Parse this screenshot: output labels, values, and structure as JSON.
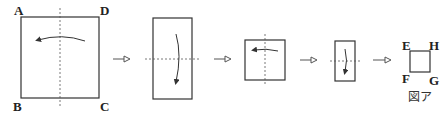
{
  "diagram": {
    "type": "paper-folding-steps",
    "stages": [
      {
        "name": "stage-1-square",
        "corners": {
          "top_left": "A",
          "top_right": "D",
          "bottom_left": "B",
          "bottom_right": "C"
        },
        "fold_line": "vertical",
        "fold_direction": "right-to-left"
      },
      {
        "name": "stage-2-rectangle",
        "fold_line": "horizontal",
        "fold_direction": "top-to-bottom"
      },
      {
        "name": "stage-3-square",
        "fold_line": "vertical",
        "fold_direction": "right-to-left"
      },
      {
        "name": "stage-4-rectangle",
        "fold_line": "horizontal",
        "fold_direction": "top-to-bottom"
      },
      {
        "name": "stage-5-final-square",
        "corners": {
          "top_left": "E",
          "top_right": "H",
          "bottom_left": "F",
          "bottom_right": "G"
        }
      }
    ],
    "labels": {
      "A": "A",
      "B": "B",
      "C": "C",
      "D": "D",
      "E": "E",
      "F": "F",
      "G": "G",
      "H": "H"
    },
    "caption": "図ア",
    "step_arrow_count": 4
  }
}
